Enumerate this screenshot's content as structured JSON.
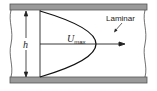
{
  "diagram": {
    "labels": {
      "profile": "Laminar",
      "velocity_symbol": "U",
      "velocity_subscript": "max",
      "height_symbol": "h"
    },
    "colors": {
      "plate_fill": "#9a9a9a",
      "plate_edge": "#555555",
      "line": "#1a1a1a"
    }
  }
}
